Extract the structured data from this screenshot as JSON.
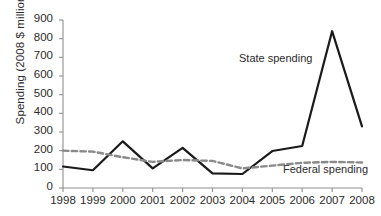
{
  "chart_data": {
    "type": "line",
    "title": "",
    "xlabel": "",
    "ylabel": "Spending (2008 $ millions)",
    "categories": [
      "1998",
      "1999",
      "2000",
      "2001",
      "2002",
      "2003",
      "2004",
      "2005",
      "2006",
      "2007",
      "2008"
    ],
    "x": [
      1998,
      1999,
      2000,
      2001,
      2002,
      2003,
      2004,
      2005,
      2006,
      2007,
      2008
    ],
    "xlim": [
      1998,
      2008
    ],
    "ylim": [
      0,
      900
    ],
    "yticks": [
      0,
      100,
      200,
      300,
      400,
      500,
      600,
      700,
      800,
      900
    ],
    "ytick_labels": [
      "0",
      "100",
      "200",
      "300",
      "400",
      "500",
      "600",
      "700",
      "800",
      "900"
    ],
    "grid": false,
    "legend_position": "inline-annotation",
    "series": [
      {
        "name": "State spending",
        "style": "solid",
        "color": "#1a1a1a",
        "values": [
          115,
          95,
          250,
          105,
          215,
          78,
          75,
          198,
          225,
          840,
          330
        ]
      },
      {
        "name": "Federal spending",
        "style": "dashed",
        "color": "#8a8a8a",
        "values": [
          200,
          195,
          165,
          140,
          150,
          145,
          105,
          120,
          135,
          140,
          137
        ]
      }
    ],
    "annotations": [
      {
        "text": "State spending",
        "series": "State spending"
      },
      {
        "text": "Federal spending",
        "series": "Federal spending"
      }
    ]
  },
  "colors": {
    "background": "#ffffff",
    "axis": "#8f8f8f",
    "text": "#2b2b2b",
    "state_line": "#1a1a1a",
    "federal_line": "#8a8a8a"
  }
}
